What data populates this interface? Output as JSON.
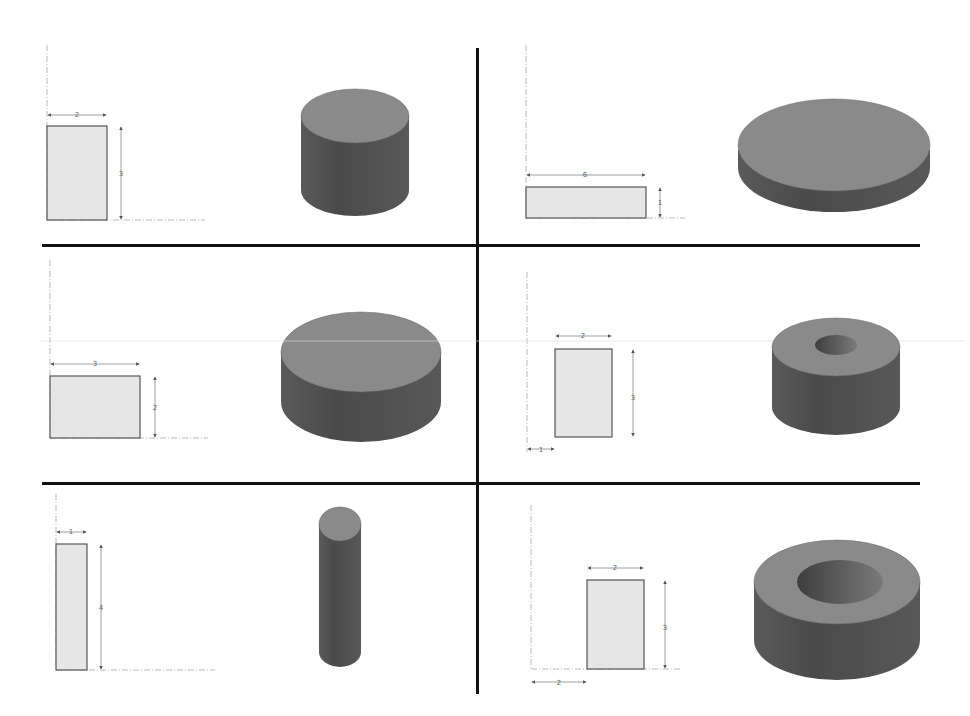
{
  "figure": {
    "colors": {
      "divider": "#111111",
      "profile_fill": "#e6e6e6",
      "profile_stroke": "#555555",
      "dimension_line": "#777777",
      "axis_line": "#aaaaaa",
      "solid_top": "#8a8a8a",
      "solid_side_dark": "#4a4a4a",
      "solid_side_light": "#6a6a6a",
      "hole_inner": "#5a5a5a"
    }
  },
  "panels": [
    {
      "id": "top-left",
      "profile": {
        "width_label": "2",
        "height_label": "3",
        "offset_label": null
      },
      "result": "solid cylinder"
    },
    {
      "id": "top-right",
      "profile": {
        "width_label": "6",
        "height_label": "1",
        "offset_label": null
      },
      "result": "flat disk"
    },
    {
      "id": "middle-left",
      "profile": {
        "width_label": "3",
        "height_label": "2",
        "offset_label": null
      },
      "result": "short wide cylinder"
    },
    {
      "id": "middle-right",
      "profile": {
        "width_label": "2",
        "height_label": "3",
        "offset_label": "1"
      },
      "result": "tube with small bore"
    },
    {
      "id": "bottom-left",
      "profile": {
        "width_label": "1",
        "height_label": "4",
        "offset_label": null
      },
      "result": "tall thin cylinder"
    },
    {
      "id": "bottom-right",
      "profile": {
        "width_label": "2",
        "height_label": "3",
        "offset_label": "2"
      },
      "result": "ring with large bore"
    }
  ]
}
